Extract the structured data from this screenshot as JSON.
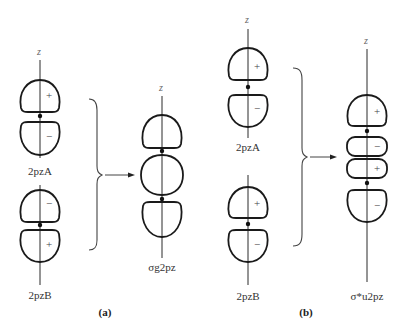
{
  "figure": {
    "axis_label": "z",
    "panel_a": {
      "caption": "(a)",
      "orbital_A": {
        "label": "2pzA",
        "upper_sign": "+",
        "lower_sign": "−"
      },
      "orbital_B": {
        "label": "2pzB",
        "upper_sign": "−",
        "lower_sign": "+"
      },
      "result": {
        "label": "σg2pz",
        "type": "bonding"
      }
    },
    "panel_b": {
      "caption": "(b)",
      "orbital_A": {
        "label": "2pzA",
        "upper_sign": "+",
        "lower_sign": "−"
      },
      "orbital_B": {
        "label": "2pzB",
        "upper_sign": "+",
        "lower_sign": "−"
      },
      "result": {
        "label": "σ*u2pz",
        "type": "antibonding",
        "signs": [
          "+",
          "−",
          "+",
          "−"
        ]
      }
    }
  }
}
